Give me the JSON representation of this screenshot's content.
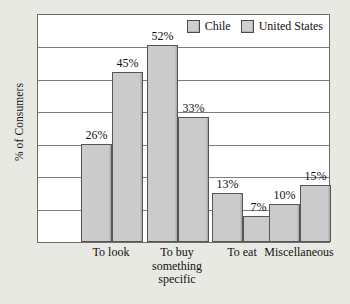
{
  "chart_data": {
    "type": "bar",
    "title": "",
    "xlabel": "",
    "ylabel": "% of Consumers",
    "ylim": [
      0,
      60
    ],
    "grid": true,
    "legend_position": "top-right",
    "categories": [
      "To look",
      "To buy something specific",
      "To eat",
      "Miscellaneous"
    ],
    "series": [
      {
        "name": "Chile",
        "values": [
          26,
          52,
          13,
          10
        ],
        "labels": [
          "26%",
          "52%",
          "13%",
          "10%"
        ],
        "color": "#cbcbcb"
      },
      {
        "name": "United States",
        "values": [
          45,
          33,
          7,
          15
        ],
        "labels": [
          "45%",
          "33%",
          "7%",
          "15%"
        ],
        "color": "#cbcbcb"
      }
    ]
  },
  "legend": {
    "items": [
      {
        "label": "Chile"
      },
      {
        "label": "United States"
      }
    ]
  },
  "axis": {
    "y_title": "% of Consumers"
  },
  "categories": [
    {
      "lines": [
        "To look"
      ]
    },
    {
      "lines": [
        "To buy",
        "something",
        "specific"
      ]
    },
    {
      "lines": [
        "To eat"
      ]
    },
    {
      "lines": [
        "Miscellaneous"
      ]
    }
  ],
  "bars": [
    {
      "series": "Chile",
      "category": "To look",
      "value": 26,
      "label": "26%"
    },
    {
      "series": "United States",
      "category": "To look",
      "value": 45,
      "label": "45%"
    },
    {
      "series": "Chile",
      "category": "To buy something specific",
      "value": 52,
      "label": "52%"
    },
    {
      "series": "United States",
      "category": "To buy something specific",
      "value": 33,
      "label": "33%"
    },
    {
      "series": "Chile",
      "category": "To eat",
      "value": 13,
      "label": "13%"
    },
    {
      "series": "United States",
      "category": "To eat",
      "value": 7,
      "label": "7%"
    },
    {
      "series": "Chile",
      "category": "Miscellaneous",
      "value": 10,
      "label": "10%"
    },
    {
      "series": "United States",
      "category": "Miscellaneous",
      "value": 15,
      "label": "15%"
    }
  ]
}
